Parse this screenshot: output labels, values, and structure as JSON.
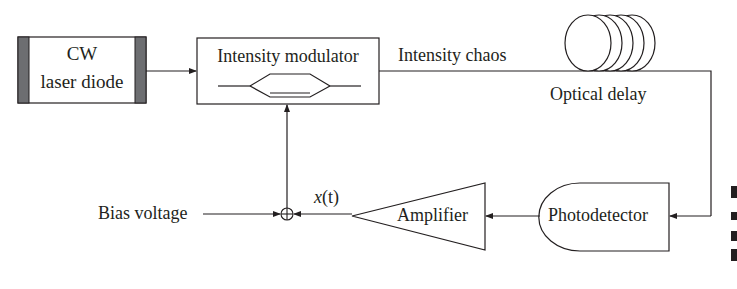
{
  "diagram": {
    "type": "block-diagram",
    "colors": {
      "stroke": "#231f20",
      "laser_end_caps": "#6d6e71",
      "background": "#ffffff"
    },
    "nodes": {
      "laser": {
        "line1": "CW",
        "line2": "laser diode"
      },
      "modulator": {
        "label": "Intensity modulator"
      },
      "chaos_label": "Intensity chaos",
      "delay": {
        "label": "Optical delay"
      },
      "photodetector": {
        "label": "Photodetector"
      },
      "amplifier": {
        "label": "Amplifier"
      },
      "signal_label": {
        "x": "x",
        "t": "(t)"
      },
      "bias": {
        "label": "Bias voltage"
      },
      "summer": {
        "symbol": "⊕"
      }
    },
    "edges": [
      {
        "from": "laser",
        "to": "modulator"
      },
      {
        "from": "modulator",
        "to": "delay",
        "label": "Intensity chaos"
      },
      {
        "from": "delay",
        "to": "photodetector"
      },
      {
        "from": "photodetector",
        "to": "amplifier"
      },
      {
        "from": "amplifier",
        "to": "summer",
        "label": "x(t)"
      },
      {
        "from": "bias",
        "to": "summer"
      },
      {
        "from": "summer",
        "to": "modulator"
      }
    ]
  }
}
